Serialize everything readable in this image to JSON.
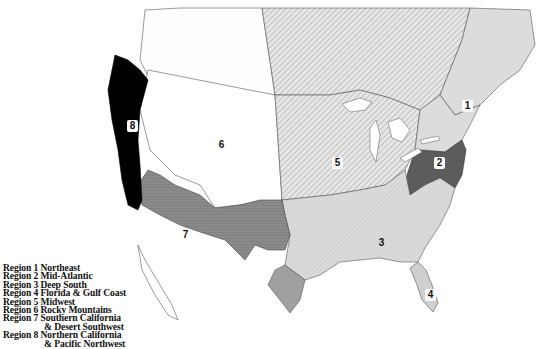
{
  "map": {
    "title_visible": false,
    "colors": {
      "background": "#ffffff",
      "outline": "#333333",
      "region_1": "#dcdcdc",
      "region_2": "#5c5c5c",
      "region_3": "#d6d6d6",
      "region_4": "#cfcfcf",
      "region_5": "#e2e2e2",
      "region_6": "#ffffff",
      "region_7": "#8a8a8a",
      "region_8": "#000000",
      "hatch": "#9a9a9a"
    },
    "region_labels": [
      {
        "id": "1",
        "text": "1",
        "x": 462,
        "y": 100
      },
      {
        "id": "2",
        "text": "2",
        "x": 434,
        "y": 163
      },
      {
        "id": "3",
        "text": "3",
        "x": 377,
        "y": 237
      },
      {
        "id": "4",
        "text": "4",
        "x": 426,
        "y": 289
      },
      {
        "id": "5",
        "text": "5",
        "x": 333,
        "y": 157
      },
      {
        "id": "6",
        "text": "6",
        "x": 217,
        "y": 140
      },
      {
        "id": "7",
        "text": "7",
        "x": 180,
        "y": 229
      },
      {
        "id": "8",
        "text": "8",
        "x": 128,
        "y": 120
      }
    ]
  },
  "legend": {
    "items": [
      {
        "line1": "Region 1 Northeast"
      },
      {
        "line1": "Region 2 Mid-Atlantic"
      },
      {
        "line1": "Region 3 Deep South"
      },
      {
        "line1": "Region 4 Florida & Gulf Coast"
      },
      {
        "line1": "Region 5 Midwest"
      },
      {
        "line1": "Region 6 Rocky Mountains"
      },
      {
        "line1": "Region 7 Southern California",
        "line2": "& Desert Southwest"
      },
      {
        "line1": "Region 8 Northern California",
        "line2": "& Pacific Northwest"
      }
    ]
  }
}
